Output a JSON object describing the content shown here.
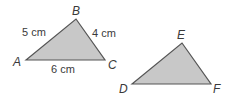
{
  "diagram": {
    "triangles": [
      {
        "name": "ABC",
        "vertices": {
          "A": {
            "label": "A",
            "x": 26,
            "y": 60
          },
          "B": {
            "label": "B",
            "x": 76,
            "y": 19
          },
          "C": {
            "label": "C",
            "x": 105,
            "y": 60
          }
        },
        "sides": {
          "AB": "5 cm",
          "BC": "4 cm",
          "AC": "6 cm"
        }
      },
      {
        "name": "DEF",
        "vertices": {
          "D": {
            "label": "D",
            "x": 132,
            "y": 84
          },
          "E": {
            "label": "E",
            "x": 182,
            "y": 43
          },
          "F": {
            "label": "F",
            "x": 211,
            "y": 84
          }
        }
      }
    ],
    "colors": {
      "fill": "#c8c8c8",
      "stroke": "#555555",
      "text": "#3a3a3a"
    }
  }
}
